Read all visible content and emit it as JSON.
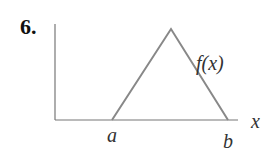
{
  "problem_number": "6.",
  "labels": {
    "function": "f(x)",
    "x_axis": "x",
    "left_point": "a",
    "right_point": "b"
  },
  "colors": {
    "axis": "#777777",
    "curve": "#888888",
    "text": "#333333"
  },
  "geometry": {
    "shape": "triangle",
    "left_base": "a",
    "right_base": "b",
    "peak": "between a and b"
  }
}
